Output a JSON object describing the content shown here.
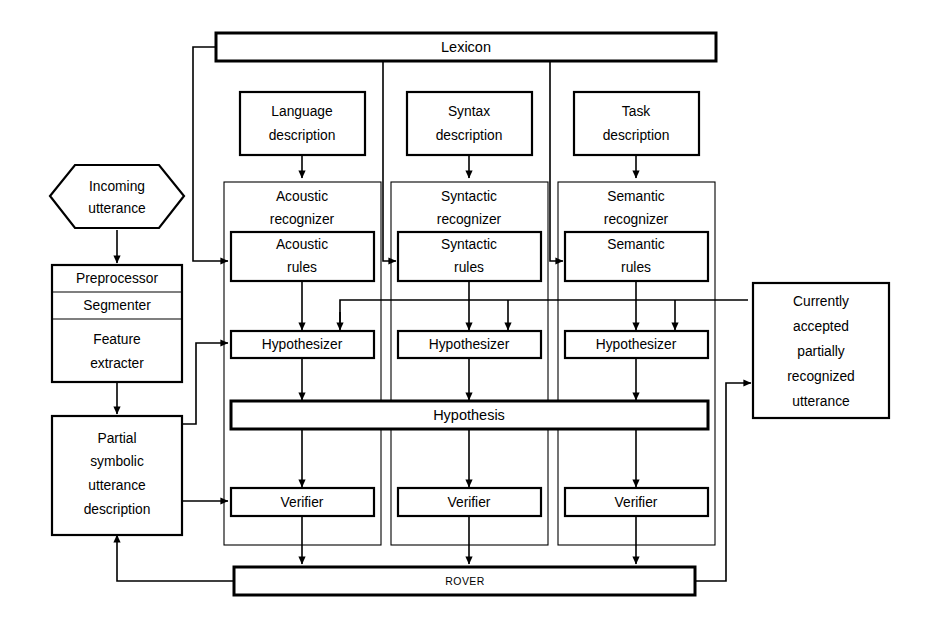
{
  "diagram": {
    "colors": {
      "stroke": "#000000",
      "background": "#ffffff",
      "fill": "#ffffff"
    },
    "nodes": {
      "lexicon": {
        "label": "Lexicon"
      },
      "incoming_utterance": {
        "line1": "Incoming",
        "line2": "utterance"
      },
      "preprocessor": {
        "label": "Preprocessor"
      },
      "segmenter": {
        "label": "Segmenter"
      },
      "feature_extracter": {
        "line1": "Feature",
        "line2": "extracter"
      },
      "partial_symbolic": {
        "line1": "Partial",
        "line2": "symbolic",
        "line3": "utterance",
        "line4": "description"
      },
      "language_description": {
        "line1": "Language",
        "line2": "description"
      },
      "syntax_description": {
        "line1": "Syntax",
        "line2": "description"
      },
      "task_description": {
        "line1": "Task",
        "line2": "description"
      },
      "acoustic_recognizer": {
        "line1": "Acoustic",
        "line2": "recognizer"
      },
      "syntactic_recognizer": {
        "line1": "Syntactic",
        "line2": "recognizer"
      },
      "semantic_recognizer": {
        "line1": "Semantic",
        "line2": "recognizer"
      },
      "acoustic_rules": {
        "line1": "Acoustic",
        "line2": "rules"
      },
      "syntactic_rules": {
        "line1": "Syntactic",
        "line2": "rules"
      },
      "semantic_rules": {
        "line1": "Semantic",
        "line2": "rules"
      },
      "hypothesizer_1": {
        "label": "Hypothesizer"
      },
      "hypothesizer_2": {
        "label": "Hypothesizer"
      },
      "hypothesizer_3": {
        "label": "Hypothesizer"
      },
      "hypothesis": {
        "label": "Hypothesis"
      },
      "verifier_1": {
        "label": "Verifier"
      },
      "verifier_2": {
        "label": "Verifier"
      },
      "verifier_3": {
        "label": "Verifier"
      },
      "rover": {
        "label": "ROVER"
      },
      "currently_accepted": {
        "line1": "Currently",
        "line2": "accepted",
        "line3": "partially",
        "line4": "recognized",
        "line5": "utterance"
      }
    }
  }
}
